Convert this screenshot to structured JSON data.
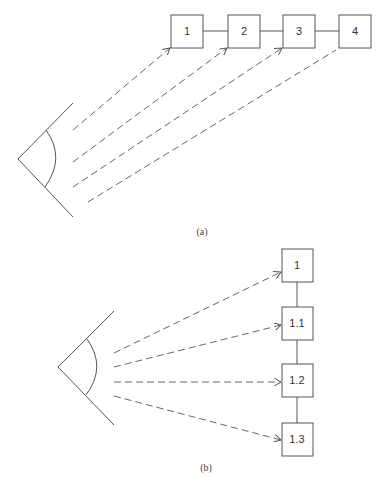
{
  "diagram_a": {
    "caption": "(a)",
    "boxes": [
      {
        "label": "1",
        "x": 171,
        "y": 15,
        "w": 32,
        "h": 33
      },
      {
        "label": "2",
        "x": 228,
        "y": 15,
        "w": 32,
        "h": 33
      },
      {
        "label": "3",
        "x": 283,
        "y": 15,
        "w": 32,
        "h": 33
      },
      {
        "label": "4",
        "x": 339,
        "y": 15,
        "w": 32,
        "h": 33
      }
    ],
    "arrangement": "horizontal chain",
    "sightlines": 4,
    "eye": "eye-icon"
  },
  "diagram_b": {
    "caption": "(b)",
    "boxes": [
      {
        "label": "1",
        "x": 282,
        "y": 249,
        "w": 31,
        "h": 33
      },
      {
        "label": "1.1",
        "x": 282,
        "y": 307,
        "w": 31,
        "h": 33
      },
      {
        "label": "1.2",
        "x": 282,
        "y": 364,
        "w": 31,
        "h": 33
      },
      {
        "label": "1.3",
        "x": 282,
        "y": 423,
        "w": 31,
        "h": 33
      }
    ],
    "arrangement": "vertical chain",
    "sightlines": 4,
    "eye": "eye-icon"
  },
  "colors": {
    "stroke": "#555555",
    "dash": "#666666",
    "background": "#ffffff"
  }
}
